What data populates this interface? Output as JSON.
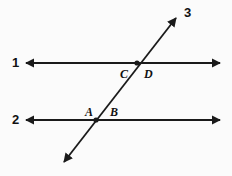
{
  "figure": {
    "kind": "geometry-diagram",
    "width": 232,
    "height": 176,
    "background_color": "#fbfbfb",
    "stroke_color": "#1a1a1a"
  },
  "lines": [
    {
      "id": "line-1",
      "label": "1",
      "label_x": 12,
      "label_y": 56,
      "x1": 26,
      "y1": 63,
      "x2": 220,
      "y2": 63,
      "arrow_start": true,
      "arrow_end": true
    },
    {
      "id": "line-2",
      "label": "2",
      "label_x": 12,
      "label_y": 113,
      "x1": 26,
      "y1": 120,
      "x2": 220,
      "y2": 120,
      "arrow_start": true,
      "arrow_end": true
    },
    {
      "id": "line-3",
      "label": "3",
      "label_x": 184,
      "label_y": 6,
      "x1": 64,
      "y1": 162,
      "x2": 176,
      "y2": 18,
      "arrow_start": true,
      "arrow_end": true
    }
  ],
  "intersections": [
    {
      "id": "intersection-upper",
      "x": 137,
      "y": 63,
      "on_lines": [
        "line-1",
        "line-3"
      ],
      "dot": true
    },
    {
      "id": "intersection-lower",
      "x": 96,
      "y": 120,
      "on_lines": [
        "line-2",
        "line-3"
      ],
      "dot": true
    }
  ],
  "point_labels": [
    {
      "id": "label-C",
      "text": "C",
      "x": 120,
      "y": 68
    },
    {
      "id": "label-D",
      "text": "D",
      "x": 144,
      "y": 68
    },
    {
      "id": "label-A",
      "text": "A",
      "x": 85,
      "y": 106
    },
    {
      "id": "label-B",
      "text": "B",
      "x": 110,
      "y": 106
    }
  ]
}
